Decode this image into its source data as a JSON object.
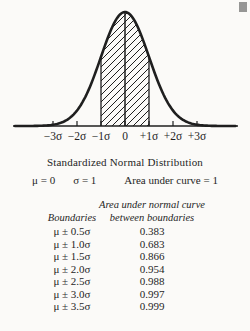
{
  "page": {
    "background": "#fbfaf8",
    "ink": "#1f1f1f"
  },
  "chart_data": {
    "type": "area",
    "title": "Standardized Normal Distribution",
    "x_tick_labels": [
      "−3σ",
      "−2σ",
      "−1σ",
      "0",
      "+1σ",
      "+2σ",
      "+3σ"
    ],
    "x_tick_sigmas": [
      -3,
      -2,
      -1,
      0,
      1,
      2,
      3
    ],
    "shaded_region_sigma": [
      -1,
      1
    ],
    "hatch_style": "diagonal",
    "params_line": {
      "mu": "μ = 0",
      "sigma": "σ = 1",
      "area": "Area under curve = 1"
    },
    "table": {
      "headers": {
        "col1": "Boundaries",
        "col2_line1": "Area under normal curve",
        "col2_line2": "between boundaries"
      },
      "rows": [
        {
          "boundary": "μ ± 0.5σ",
          "area": "0.383"
        },
        {
          "boundary": "μ ± 1.0σ",
          "area": "0.683"
        },
        {
          "boundary": "μ ± 1.5σ",
          "area": "0.866"
        },
        {
          "boundary": "μ ± 2.0σ",
          "area": "0.954"
        },
        {
          "boundary": "μ ± 2.5σ",
          "area": "0.988"
        },
        {
          "boundary": "μ ± 3.0σ",
          "area": "0.997"
        },
        {
          "boundary": "μ ± 3.5σ",
          "area": "0.999"
        }
      ]
    },
    "geometry": {
      "svg_width": 250,
      "svg_height": 150,
      "center_x": 125,
      "sigma_px": 24,
      "axis_y": 126,
      "peak_y": 12,
      "axis_x0": 13,
      "axis_x1": 238,
      "curve_x0": 15,
      "curve_x1": 236,
      "tick_len": 5,
      "label_y": 140,
      "label_font": 11.5,
      "curve_stroke": 2.6,
      "axis_stroke": 1.6,
      "boundary_stroke": 1.3,
      "hatch_tile": 7,
      "hatch_stroke": 1
    }
  }
}
